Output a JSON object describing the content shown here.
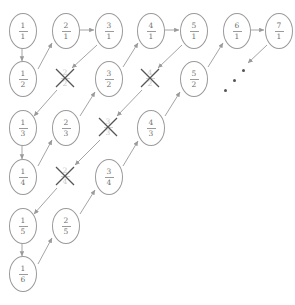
{
  "diagram": {
    "colors": {
      "stroke": "#9a9a9a",
      "text": "#6f6f6f",
      "crossed": "#c8c8c8",
      "dot": "#555555",
      "background": "#ffffff"
    },
    "grid": {
      "columns_x": [
        22,
        65,
        108,
        150,
        193,
        236,
        278
      ],
      "rows_y": [
        30,
        78,
        127,
        176,
        225,
        273
      ]
    },
    "nodes": [
      {
        "name": "node-1-1",
        "num": "1",
        "den": "1",
        "col": 0,
        "row": 0,
        "crossed": false
      },
      {
        "name": "node-2-1",
        "num": "2",
        "den": "1",
        "col": 1,
        "row": 0,
        "crossed": false
      },
      {
        "name": "node-3-1",
        "num": "3",
        "den": "1",
        "col": 2,
        "row": 0,
        "crossed": false
      },
      {
        "name": "node-4-1",
        "num": "4",
        "den": "1",
        "col": 3,
        "row": 0,
        "crossed": false
      },
      {
        "name": "node-5-1",
        "num": "5",
        "den": "1",
        "col": 4,
        "row": 0,
        "crossed": false
      },
      {
        "name": "node-6-1",
        "num": "6",
        "den": "1",
        "col": 5,
        "row": 0,
        "crossed": false
      },
      {
        "name": "node-7-1",
        "num": "7",
        "den": "1",
        "col": 6,
        "row": 0,
        "crossed": false
      },
      {
        "name": "node-1-2",
        "num": "1",
        "den": "2",
        "col": 0,
        "row": 1,
        "crossed": false
      },
      {
        "name": "node-2-2",
        "num": "2",
        "den": "2",
        "col": 1,
        "row": 1,
        "crossed": true
      },
      {
        "name": "node-3-2",
        "num": "3",
        "den": "2",
        "col": 2,
        "row": 1,
        "crossed": false
      },
      {
        "name": "node-4-2",
        "num": "4",
        "den": "2",
        "col": 3,
        "row": 1,
        "crossed": true
      },
      {
        "name": "node-5-2",
        "num": "5",
        "den": "2",
        "col": 4,
        "row": 1,
        "crossed": false
      },
      {
        "name": "node-1-3",
        "num": "1",
        "den": "3",
        "col": 0,
        "row": 2,
        "crossed": false
      },
      {
        "name": "node-2-3",
        "num": "2",
        "den": "3",
        "col": 1,
        "row": 2,
        "crossed": false
      },
      {
        "name": "node-3-3",
        "num": "3",
        "den": "3",
        "col": 2,
        "row": 2,
        "crossed": true
      },
      {
        "name": "node-4-3",
        "num": "4",
        "den": "3",
        "col": 3,
        "row": 2,
        "crossed": false
      },
      {
        "name": "node-1-4",
        "num": "1",
        "den": "4",
        "col": 0,
        "row": 3,
        "crossed": false
      },
      {
        "name": "node-2-4",
        "num": "2",
        "den": "4",
        "col": 1,
        "row": 3,
        "crossed": true
      },
      {
        "name": "node-3-4",
        "num": "3",
        "den": "4",
        "col": 2,
        "row": 3,
        "crossed": false
      },
      {
        "name": "node-1-5",
        "num": "1",
        "den": "5",
        "col": 0,
        "row": 4,
        "crossed": false
      },
      {
        "name": "node-2-5",
        "num": "2",
        "den": "5",
        "col": 1,
        "row": 4,
        "crossed": false
      },
      {
        "name": "node-1-6",
        "num": "1",
        "den": "6",
        "col": 0,
        "row": 5,
        "crossed": false
      }
    ],
    "edges": [
      {
        "name": "arrow-1-1-to-1-2",
        "x1": 22,
        "y1": 47,
        "x2": 22,
        "y2": 61,
        "kind": "vertical-down"
      },
      {
        "name": "arrow-1-2-to-2-1",
        "x1": 38,
        "y1": 69,
        "x2": 52,
        "y2": 43,
        "kind": "diagonal-up-right"
      },
      {
        "name": "arrow-2-1-to-3-1",
        "x1": 80,
        "y1": 30,
        "x2": 94,
        "y2": 30,
        "kind": "horizontal-right"
      },
      {
        "name": "arrow-3-1-to-2-2",
        "x1": 97,
        "y1": 45,
        "x2": 72,
        "y2": 68,
        "kind": "diagonal-down-left"
      },
      {
        "name": "arrow-2-2-to-1-3",
        "x1": 57,
        "y1": 90,
        "x2": 34,
        "y2": 116,
        "kind": "diagonal-down-left"
      },
      {
        "name": "arrow-1-3-to-1-4",
        "x1": 22,
        "y1": 145,
        "x2": 22,
        "y2": 159,
        "kind": "vertical-down"
      },
      {
        "name": "arrow-1-4-to-2-3",
        "x1": 38,
        "y1": 166,
        "x2": 52,
        "y2": 140,
        "kind": "diagonal-up-right"
      },
      {
        "name": "arrow-2-3-to-3-2",
        "x1": 80,
        "y1": 116,
        "x2": 95,
        "y2": 92,
        "kind": "diagonal-up-right"
      },
      {
        "name": "arrow-3-2-to-4-1",
        "x1": 123,
        "y1": 67,
        "x2": 138,
        "y2": 43,
        "kind": "diagonal-up-right"
      },
      {
        "name": "arrow-4-1-to-5-1",
        "x1": 165,
        "y1": 30,
        "x2": 179,
        "y2": 30,
        "kind": "horizontal-right"
      },
      {
        "name": "arrow-5-1-to-4-2",
        "x1": 182,
        "y1": 45,
        "x2": 158,
        "y2": 68,
        "kind": "diagonal-down-left"
      },
      {
        "name": "arrow-4-2-to-3-3",
        "x1": 142,
        "y1": 90,
        "x2": 117,
        "y2": 116,
        "kind": "diagonal-down-left"
      },
      {
        "name": "arrow-3-3-to-2-4",
        "x1": 100,
        "y1": 140,
        "x2": 75,
        "y2": 165,
        "kind": "diagonal-down-left"
      },
      {
        "name": "arrow-2-4-to-1-5",
        "x1": 57,
        "y1": 188,
        "x2": 34,
        "y2": 214,
        "kind": "diagonal-down-left"
      },
      {
        "name": "arrow-1-5-to-1-6",
        "x1": 22,
        "y1": 243,
        "x2": 22,
        "y2": 256,
        "kind": "vertical-down"
      },
      {
        "name": "arrow-1-6-to-2-5",
        "x1": 38,
        "y1": 264,
        "x2": 52,
        "y2": 238,
        "kind": "diagonal-up-right"
      },
      {
        "name": "arrow-2-5-to-3-4",
        "x1": 80,
        "y1": 214,
        "x2": 95,
        "y2": 190,
        "kind": "diagonal-up-right"
      },
      {
        "name": "arrow-3-4-to-4-3",
        "x1": 123,
        "y1": 166,
        "x2": 138,
        "y2": 141,
        "kind": "diagonal-up-right"
      },
      {
        "name": "arrow-4-3-to-5-2",
        "x1": 165,
        "y1": 116,
        "x2": 180,
        "y2": 92,
        "kind": "diagonal-up-right"
      },
      {
        "name": "arrow-5-2-to-6-1",
        "x1": 208,
        "y1": 67,
        "x2": 223,
        "y2": 43,
        "kind": "diagonal-up-right"
      },
      {
        "name": "arrow-6-1-to-7-1",
        "x1": 250,
        "y1": 30,
        "x2": 264,
        "y2": 30,
        "kind": "horizontal-right"
      },
      {
        "name": "arrow-7-1-down-left",
        "x1": 267,
        "y1": 45,
        "x2": 248,
        "y2": 63,
        "kind": "diagonal-down-left"
      }
    ],
    "ellipsis_dots": [
      {
        "name": "ellipsis-dot-1",
        "x": 243,
        "y": 70
      },
      {
        "name": "ellipsis-dot-2",
        "x": 234,
        "y": 80
      },
      {
        "name": "ellipsis-dot-3",
        "x": 225,
        "y": 90
      }
    ]
  }
}
